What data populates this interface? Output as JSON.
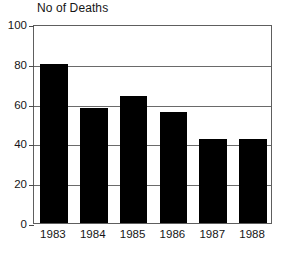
{
  "chart_data": {
    "type": "bar",
    "title": "No of Deaths",
    "xlabel": "",
    "ylabel": "No of Deaths",
    "categories": [
      "1983",
      "1984",
      "1985",
      "1986",
      "1987",
      "1988"
    ],
    "values": [
      80,
      58,
      64,
      56,
      42,
      42
    ],
    "ylim": [
      0,
      100
    ],
    "yticks": [
      0,
      20,
      40,
      60,
      80,
      100
    ],
    "ytick_labels": [
      "0",
      "20",
      "40",
      "60",
      "80",
      "100"
    ],
    "gridlines": [
      20,
      40,
      60,
      80
    ],
    "grid": true,
    "legend": null,
    "legend_position": "none",
    "bar_color": "#000000",
    "axis_color": "#5e5e5e",
    "grid_color": "#6a6a6a",
    "background": "#ffffff"
  }
}
